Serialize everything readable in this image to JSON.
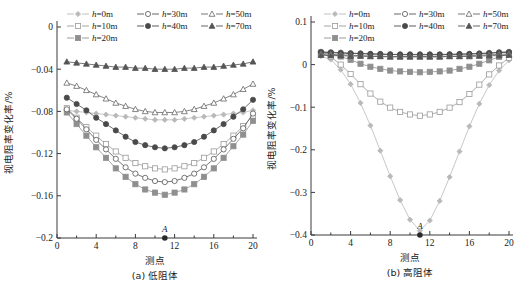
{
  "figure": {
    "panels": [
      {
        "id": "panel-a",
        "caption": "(a) 低阻体",
        "xlabel": "测点",
        "ylabel": "视电阻率变化率/%",
        "point_label": "A"
      },
      {
        "id": "panel-b",
        "caption": "(b) 高阻体",
        "xlabel": "测点",
        "ylabel": "视电阻率变化率/%",
        "point_label": "A"
      }
    ]
  },
  "legend": {
    "entries": [
      {
        "label": "h=0m",
        "var": "h",
        "rest": "=0m",
        "marker": "diamond-filled",
        "color": "#b9b9b9"
      },
      {
        "label": "h=10m",
        "var": "h",
        "rest": "=10m",
        "marker": "square-open",
        "color": "#9a9a9a"
      },
      {
        "label": "h=20m",
        "var": "h",
        "rest": "=20m",
        "marker": "square-filled",
        "color": "#8f8f8f"
      },
      {
        "label": "h=30m",
        "var": "h",
        "rest": "=30m",
        "marker": "circle-open",
        "color": "#555555"
      },
      {
        "label": "h=40m",
        "var": "h",
        "rest": "=40m",
        "marker": "circle-filled",
        "color": "#4a4a4a"
      },
      {
        "label": "h=50m",
        "var": "h",
        "rest": "=50m",
        "marker": "triangle-open",
        "color": "#666666"
      },
      {
        "label": "h=70m",
        "var": "h",
        "rest": "=70m",
        "marker": "triangle-filled",
        "color": "#555555"
      }
    ],
    "order_rows": [
      [
        0,
        3,
        5
      ],
      [
        1,
        4,
        6
      ],
      [
        2
      ]
    ]
  },
  "chart_data": [
    {
      "type": "line",
      "title": "(a) 低阻体",
      "xlabel": "测点",
      "ylabel": "视电阻率变化率/%",
      "xlim": [
        0,
        20
      ],
      "ylim": [
        -0.2,
        0
      ],
      "xticks": [
        0,
        4,
        8,
        12,
        16,
        20
      ],
      "yticks": [
        0,
        -0.04,
        -0.08,
        -0.12,
        -0.16,
        -0.2
      ],
      "grid": false,
      "legend_position": "top",
      "annotations": [
        {
          "text": "A",
          "x": 11,
          "y": -0.2
        }
      ],
      "x": [
        1,
        2,
        3,
        4,
        5,
        6,
        7,
        8,
        9,
        10,
        11,
        12,
        13,
        14,
        15,
        16,
        17,
        18,
        19,
        20
      ],
      "series": [
        {
          "name": "h=0m",
          "marker": "diamond-filled",
          "color": "#b9b9b9",
          "values": [
            -0.079,
            -0.08,
            -0.081,
            -0.082,
            -0.083,
            -0.084,
            -0.085,
            -0.086,
            -0.087,
            -0.088,
            -0.088,
            -0.088,
            -0.087,
            -0.086,
            -0.085,
            -0.084,
            -0.083,
            -0.082,
            -0.081,
            -0.079
          ]
        },
        {
          "name": "h=10m",
          "marker": "square-open",
          "color": "#9a9a9a",
          "values": [
            -0.077,
            -0.086,
            -0.095,
            -0.103,
            -0.111,
            -0.118,
            -0.124,
            -0.129,
            -0.132,
            -0.134,
            -0.135,
            -0.134,
            -0.132,
            -0.129,
            -0.124,
            -0.118,
            -0.111,
            -0.103,
            -0.094,
            -0.084
          ]
        },
        {
          "name": "h=20m",
          "marker": "square-filled",
          "color": "#8f8f8f",
          "values": [
            -0.081,
            -0.092,
            -0.103,
            -0.114,
            -0.124,
            -0.134,
            -0.142,
            -0.149,
            -0.154,
            -0.157,
            -0.159,
            -0.157,
            -0.154,
            -0.149,
            -0.142,
            -0.134,
            -0.124,
            -0.113,
            -0.102,
            -0.089
          ]
        },
        {
          "name": "h=30m",
          "marker": "circle-open",
          "color": "#555555",
          "values": [
            -0.078,
            -0.087,
            -0.097,
            -0.107,
            -0.116,
            -0.125,
            -0.133,
            -0.139,
            -0.143,
            -0.146,
            -0.147,
            -0.146,
            -0.143,
            -0.139,
            -0.133,
            -0.125,
            -0.116,
            -0.106,
            -0.096,
            -0.082
          ]
        },
        {
          "name": "h=40m",
          "marker": "circle-filled",
          "color": "#4a4a4a",
          "values": [
            -0.067,
            -0.073,
            -0.079,
            -0.086,
            -0.092,
            -0.098,
            -0.104,
            -0.109,
            -0.112,
            -0.114,
            -0.115,
            -0.114,
            -0.112,
            -0.109,
            -0.104,
            -0.098,
            -0.092,
            -0.085,
            -0.078,
            -0.069
          ]
        },
        {
          "name": "h=50m",
          "marker": "triangle-open",
          "color": "#666666",
          "values": [
            -0.053,
            -0.056,
            -0.06,
            -0.064,
            -0.068,
            -0.072,
            -0.075,
            -0.078,
            -0.08,
            -0.081,
            -0.081,
            -0.081,
            -0.08,
            -0.078,
            -0.075,
            -0.072,
            -0.068,
            -0.064,
            -0.059,
            -0.054
          ]
        },
        {
          "name": "h=70m",
          "marker": "triangle-filled",
          "color": "#555555",
          "values": [
            -0.033,
            -0.034,
            -0.035,
            -0.036,
            -0.037,
            -0.038,
            -0.038,
            -0.039,
            -0.039,
            -0.04,
            -0.04,
            -0.04,
            -0.039,
            -0.039,
            -0.038,
            -0.038,
            -0.037,
            -0.036,
            -0.035,
            -0.033
          ]
        }
      ]
    },
    {
      "type": "line",
      "title": "(b) 高阻体",
      "xlabel": "测点",
      "ylabel": "视电阻率变化率/%",
      "xlim": [
        0,
        20
      ],
      "ylim": [
        -0.4,
        0.1
      ],
      "xticks": [
        0,
        4,
        8,
        12,
        16,
        20
      ],
      "yticks": [
        0.1,
        0,
        -0.1,
        -0.2,
        -0.3,
        -0.4
      ],
      "grid": false,
      "legend_position": "top",
      "annotations": [
        {
          "text": "A",
          "x": 11,
          "y": -0.4
        }
      ],
      "x": [
        1,
        2,
        3,
        4,
        5,
        6,
        7,
        8,
        9,
        10,
        11,
        12,
        13,
        14,
        15,
        16,
        17,
        18,
        19,
        20
      ],
      "series": [
        {
          "name": "h=0m",
          "marker": "diamond-filled",
          "color": "#b9b9b9",
          "values": [
            0.02,
            0.012,
            -0.012,
            -0.046,
            -0.09,
            -0.143,
            -0.202,
            -0.262,
            -0.318,
            -0.364,
            -0.39,
            -0.366,
            -0.32,
            -0.264,
            -0.204,
            -0.145,
            -0.092,
            -0.048,
            -0.014,
            0.01
          ]
        },
        {
          "name": "h=10m",
          "marker": "square-open",
          "color": "#9a9a9a",
          "values": [
            0.027,
            0.018,
            0.0,
            -0.022,
            -0.046,
            -0.068,
            -0.087,
            -0.101,
            -0.111,
            -0.117,
            -0.12,
            -0.117,
            -0.111,
            -0.101,
            -0.088,
            -0.069,
            -0.047,
            -0.023,
            -0.002,
            0.016
          ]
        },
        {
          "name": "h=20m",
          "marker": "square-filled",
          "color": "#8f8f8f",
          "values": [
            0.028,
            0.025,
            0.019,
            0.011,
            0.002,
            -0.005,
            -0.01,
            -0.014,
            -0.016,
            -0.017,
            -0.018,
            -0.017,
            -0.016,
            -0.014,
            -0.01,
            -0.005,
            0.002,
            0.01,
            0.018,
            0.026
          ]
        },
        {
          "name": "h=30m",
          "marker": "circle-open",
          "color": "#555555",
          "values": [
            0.03,
            0.029,
            0.028,
            0.027,
            0.026,
            0.025,
            0.024,
            0.024,
            0.023,
            0.023,
            0.023,
            0.023,
            0.023,
            0.024,
            0.024,
            0.025,
            0.026,
            0.027,
            0.029,
            0.03
          ]
        },
        {
          "name": "h=40m",
          "marker": "circle-filled",
          "color": "#4a4a4a",
          "values": [
            0.029,
            0.028,
            0.027,
            0.026,
            0.026,
            0.025,
            0.025,
            0.024,
            0.024,
            0.024,
            0.024,
            0.024,
            0.024,
            0.024,
            0.025,
            0.025,
            0.026,
            0.027,
            0.028,
            0.029
          ]
        },
        {
          "name": "h=50m",
          "marker": "triangle-open",
          "color": "#666666",
          "values": [
            0.025,
            0.024,
            0.023,
            0.022,
            0.021,
            0.02,
            0.02,
            0.019,
            0.019,
            0.019,
            0.019,
            0.019,
            0.019,
            0.02,
            0.02,
            0.021,
            0.022,
            0.023,
            0.024,
            0.025
          ]
        },
        {
          "name": "h=70m",
          "marker": "triangle-filled",
          "color": "#555555",
          "values": [
            0.022,
            0.021,
            0.021,
            0.02,
            0.02,
            0.019,
            0.019,
            0.018,
            0.018,
            0.018,
            0.018,
            0.018,
            0.018,
            0.019,
            0.019,
            0.019,
            0.02,
            0.021,
            0.021,
            0.022
          ]
        }
      ]
    }
  ]
}
